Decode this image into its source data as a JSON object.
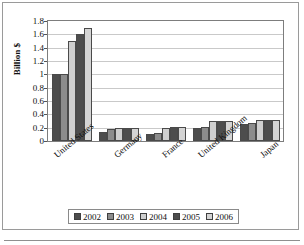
{
  "chart_data": {
    "type": "bar",
    "title": "",
    "xlabel": "",
    "ylabel": "Billion $",
    "ylim": [
      0,
      1.8
    ],
    "ytick_labels": [
      "1.8",
      "1.6",
      "1.4",
      "1.2",
      "1",
      "0.8",
      "0.6",
      "0.4",
      "0.2",
      "0"
    ],
    "ytick_values": [
      1.8,
      1.6,
      1.4,
      1.2,
      1.0,
      0.8,
      0.6,
      0.4,
      0.2,
      0
    ],
    "grid": true,
    "legend_position": "bottom",
    "categories": [
      "United States",
      "Germany",
      "France",
      "United Kingdom",
      "Japan"
    ],
    "series": [
      {
        "name": "2002",
        "color": "#4d4d4d",
        "values": [
          1.0,
          0.14,
          0.1,
          0.19,
          0.26
        ]
      },
      {
        "name": "2003",
        "color": "#8c8c8c",
        "values": [
          1.0,
          0.18,
          0.12,
          0.21,
          0.27
        ]
      },
      {
        "name": "2004",
        "color": "#cfcfcf",
        "values": [
          1.5,
          0.2,
          0.2,
          0.3,
          0.31
        ]
      },
      {
        "name": "2005",
        "color": "#4d4d4d",
        "values": [
          1.6,
          0.2,
          0.21,
          0.3,
          0.31
        ]
      },
      {
        "name": "2006",
        "color": "#d4d4d4",
        "values": [
          1.7,
          0.2,
          0.21,
          0.3,
          0.31
        ]
      }
    ]
  },
  "axis": {
    "y_title": "Billion $"
  },
  "legend": {
    "items": [
      {
        "label": "2002"
      },
      {
        "label": "2003"
      },
      {
        "label": "2004"
      },
      {
        "label": "2005"
      },
      {
        "label": "2006"
      }
    ]
  }
}
